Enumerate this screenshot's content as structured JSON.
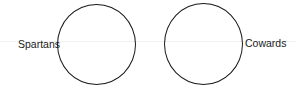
{
  "diagram": {
    "circles": [
      {
        "label": "Spartans",
        "label_side": "left"
      },
      {
        "label": "Cowards",
        "label_side": "right"
      }
    ]
  }
}
